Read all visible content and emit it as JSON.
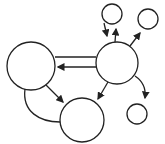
{
  "diagram": {
    "type": "directed-graph",
    "stroke_color": "#222222",
    "fill_color": "#ffffff",
    "nodes": [
      {
        "id": "A",
        "cx": 31,
        "cy": 66,
        "r": 24
      },
      {
        "id": "B",
        "cx": 117,
        "cy": 63,
        "r": 21
      },
      {
        "id": "C",
        "cx": 82,
        "cy": 120,
        "r": 22
      },
      {
        "id": "D",
        "cx": 112,
        "cy": 14,
        "r": 10
      },
      {
        "id": "E",
        "cx": 148,
        "cy": 19,
        "r": 10
      },
      {
        "id": "F",
        "cx": 137,
        "cy": 114,
        "r": 10
      }
    ],
    "edges": [
      {
        "from": "B",
        "to": "A",
        "arrow": false,
        "label": "upper parallel line"
      },
      {
        "from": "B",
        "to": "A",
        "arrow": true
      },
      {
        "from": "A",
        "to": "C",
        "arrow": true
      },
      {
        "from": "A",
        "to": "C",
        "arrow": false,
        "label": "curved line"
      },
      {
        "from": "B",
        "to": "C",
        "arrow": true
      },
      {
        "from": "D",
        "to": "B",
        "arrow": true
      },
      {
        "from": "B",
        "to": "D",
        "arrow": true
      },
      {
        "from": "B",
        "to": "E",
        "arrow": true
      },
      {
        "from": "B",
        "to": "F",
        "arrow": true,
        "label": "curved"
      }
    ]
  }
}
